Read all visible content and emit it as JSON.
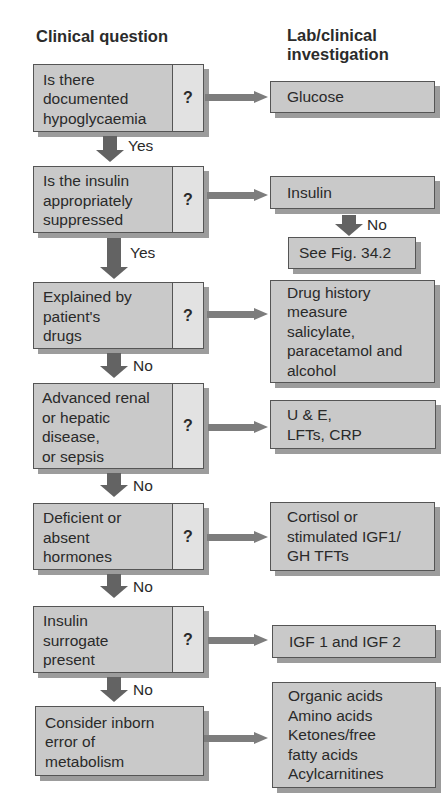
{
  "headers": {
    "left": "Clinical question",
    "right_line1": "Lab/clinical",
    "right_line2": "investigation"
  },
  "questions": [
    {
      "lines": [
        "Is there",
        "documented",
        "hypoglycaemia"
      ],
      "mark": "?"
    },
    {
      "lines": [
        "Is the insulin",
        "appropriately",
        "suppressed"
      ],
      "mark": "?"
    },
    {
      "lines": [
        "Explained by",
        "patient's",
        "drugs"
      ],
      "mark": "?"
    },
    {
      "lines": [
        "Advanced renal",
        "or hepatic",
        "disease,",
        "or sepsis"
      ],
      "mark": "?"
    },
    {
      "lines": [
        "Deficient or",
        "absent",
        "hormones"
      ],
      "mark": "?"
    },
    {
      "lines": [
        "Insulin",
        "surrogate",
        "present"
      ],
      "mark": "?"
    },
    {
      "lines": [
        "Consider inborn",
        "error of",
        "metabolism"
      ]
    }
  ],
  "investigations": [
    {
      "lines": [
        "Glucose"
      ]
    },
    {
      "lines": [
        "Insulin"
      ]
    },
    {
      "lines": [
        "Drug history",
        "measure",
        "salicylate,",
        "paracetamol and",
        "alcohol"
      ]
    },
    {
      "lines": [
        "U & E,",
        "LFTs, CRP"
      ]
    },
    {
      "lines": [
        "Cortisol or",
        "stimulated IGF1/",
        "GH TFTs"
      ]
    },
    {
      "lines": [
        "IGF 1 and IGF 2"
      ]
    },
    {
      "lines": [
        "Organic acids",
        "Amino acids",
        "Ketones/free",
        "fatty acids",
        "Acylcarnitines"
      ]
    }
  ],
  "insulin_branch": {
    "label": "No",
    "target": "See Fig. 34.2"
  },
  "flow_labels": [
    "Yes",
    "Yes",
    "No",
    "No",
    "No",
    "No"
  ],
  "colors": {
    "box_fill": "#c9c9c9",
    "question_mark_fill": "#e2e2e2",
    "border": "#555555",
    "shadow": "#9c9c9c",
    "horizontal_arrow": "#7d7d7d",
    "vertical_arrow": "#636363"
  }
}
